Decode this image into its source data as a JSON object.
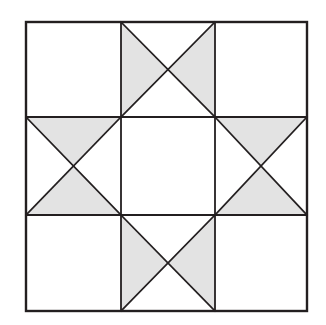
{
  "figure": {
    "type": "geometric-diagram"
  },
  "canvas": {
    "width": 326,
    "height": 325,
    "background_color": "#ffffff"
  },
  "style": {
    "fill_shaded": "#E3E3E3",
    "fill_plain": "#FFFFFF",
    "line_color": "#231F20",
    "outer_border_width": 2.4,
    "grid_line_width": 1.8,
    "diagonal_line_width": 1.7
  },
  "geometry": {
    "block_left": 26,
    "block_top": 22,
    "block_right": 307,
    "block_bottom": 311,
    "columns": 3,
    "rows": 3,
    "vertical_grid_x": [
      121,
      215
    ],
    "horizontal_grid_y": [
      117,
      215
    ],
    "column_edges": [
      26,
      121,
      215,
      307
    ],
    "row_edges": [
      22,
      117,
      215,
      311
    ]
  },
  "cells": [
    {
      "id": "cell-top-left",
      "row": 0,
      "col": 0,
      "pattern": "plain",
      "shaded_triangles": [],
      "label": "Top left plain square"
    },
    {
      "id": "cell-top-center",
      "row": 0,
      "col": 1,
      "pattern": "quarter-square-x",
      "shaded_triangles": [
        "left",
        "right"
      ],
      "label": "Top center quarter square triangles, left and right shaded"
    },
    {
      "id": "cell-top-right",
      "row": 0,
      "col": 2,
      "pattern": "plain",
      "shaded_triangles": [],
      "label": "Top right plain square"
    },
    {
      "id": "cell-middle-left",
      "row": 1,
      "col": 0,
      "pattern": "quarter-square-x",
      "shaded_triangles": [
        "top",
        "bottom"
      ],
      "label": "Middle left quarter square triangles, top and bottom shaded"
    },
    {
      "id": "cell-center",
      "row": 1,
      "col": 1,
      "pattern": "plain",
      "shaded_triangles": [],
      "label": "Center plain square"
    },
    {
      "id": "cell-middle-right",
      "row": 1,
      "col": 2,
      "pattern": "quarter-square-x",
      "shaded_triangles": [
        "top",
        "bottom"
      ],
      "label": "Middle right quarter square triangles, top and bottom shaded"
    },
    {
      "id": "cell-bottom-left",
      "row": 2,
      "col": 0,
      "pattern": "plain",
      "shaded_triangles": [],
      "label": "Bottom left plain square"
    },
    {
      "id": "cell-bottom-center",
      "row": 2,
      "col": 1,
      "pattern": "quarter-square-x",
      "shaded_triangles": [
        "left",
        "right"
      ],
      "label": "Bottom center quarter square triangles, left and right shaded"
    },
    {
      "id": "cell-bottom-right",
      "row": 2,
      "col": 2,
      "pattern": "plain",
      "shaded_triangles": [],
      "label": "Bottom right plain square"
    }
  ]
}
